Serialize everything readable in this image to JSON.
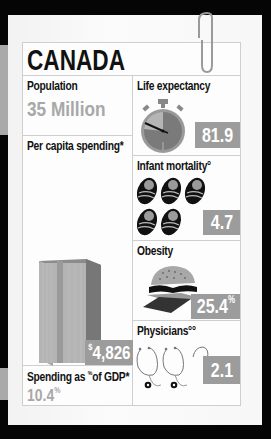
{
  "country": "CANADA",
  "population": {
    "label": "Population",
    "value": "35 Million"
  },
  "life_expectancy": {
    "label": "Life expectancy",
    "value": "81.9",
    "icon": "stopwatch-icon"
  },
  "per_capita_spending": {
    "label": "Per capita spending*",
    "currency_symbol": "$",
    "value": "4,826",
    "icon": "money-stack-icon"
  },
  "infant_mortality": {
    "label": "Infant mortality°",
    "value": "4.7",
    "icon": "baby-icon",
    "icon_count": 5
  },
  "obesity": {
    "label": "Obesity",
    "value": "25.4",
    "unit": "%",
    "icon": "burger-icon"
  },
  "spending_gdp": {
    "label_prefix": "Spending as ",
    "label_unit": "%",
    "label_suffix": "of GDP*",
    "value": "10.4",
    "unit": "%"
  },
  "physicians": {
    "label": "Physicians°°",
    "value": "2.1",
    "icon": "stethoscope-icon",
    "icon_count": 3
  },
  "colors": {
    "accent_box": "#9c9c9c",
    "muted_text": "#a8a8a8",
    "background": "#050505",
    "paper": "#f7f7f7"
  }
}
